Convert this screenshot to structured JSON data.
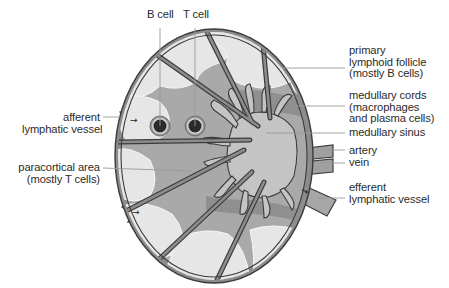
{
  "diagram": {
    "type": "anatomical-cross-section",
    "colors": {
      "capsule": "#8a8a8a",
      "capsule_outline": "#3c3c3c",
      "follicle": "#e6e6e6",
      "paracortex": "#a9a9a9",
      "medullary_cord": "#8f8f8f",
      "medullary_sinus": "#c4c4c4",
      "cell_core": "#2a2a2a",
      "cell_ring": "#9a9a9a",
      "leader_line": "#9a9a9a",
      "text": "#2b2b2b"
    }
  },
  "labels": {
    "b_cell": "B cell",
    "t_cell": "T cell",
    "afferent": [
      "afferent",
      "lymphatic vessel"
    ],
    "paracortical": [
      "paracortical area",
      "(mostly T cells)"
    ],
    "primary_follicle": [
      "primary",
      "lymphoid follicle",
      "(mostly B cells)"
    ],
    "medullary_cords": [
      "medullary cords",
      "(macrophages",
      "and plasma cells)"
    ],
    "medullary_sinus": "medullary sinus",
    "artery": "artery",
    "vein": "vein",
    "efferent": [
      "efferent",
      "lymphatic vessel"
    ]
  },
  "icons": {
    "flow_arrow": "→"
  }
}
